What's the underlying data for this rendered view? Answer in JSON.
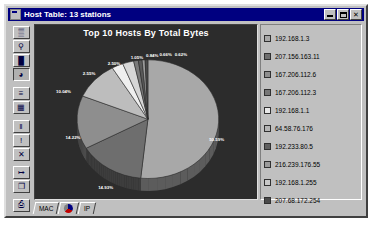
{
  "window": {
    "title": "Host Table: 13 stations",
    "icon": "app-icon",
    "buttons": [
      {
        "name": "minimize-button",
        "glyph": ""
      },
      {
        "name": "maximize-button",
        "glyph": ""
      },
      {
        "name": "close-button",
        "glyph": "✕"
      }
    ]
  },
  "toolbar": {
    "buttons": [
      {
        "name": "tool-table-icon",
        "glyph": "▒"
      },
      {
        "name": "tool-magnifier-icon",
        "glyph": "⚲"
      },
      {
        "name": "tool-bar-chart-icon",
        "glyph": "█"
      },
      {
        "name": "tool-pie-chart-icon",
        "glyph": "◕",
        "pressed": true
      },
      {
        "name": "tool-list-icon",
        "glyph": "≡"
      },
      {
        "name": "tool-grid-icon",
        "glyph": "▦"
      },
      {
        "name": "tool-pause-icon",
        "glyph": "‖"
      },
      {
        "name": "tool-alarm-icon",
        "glyph": "!"
      },
      {
        "name": "tool-delete-icon",
        "glyph": "✕"
      },
      {
        "name": "tool-export-icon",
        "glyph": "↦"
      },
      {
        "name": "tool-copy-icon",
        "glyph": "❐"
      },
      {
        "name": "tool-print-icon",
        "glyph": "⎙"
      }
    ]
  },
  "chart_data": {
    "type": "pie",
    "title": "Top 10 Hosts By Total Bytes",
    "xlabel": "",
    "ylabel": "",
    "legend_position": "right",
    "grid": false,
    "categories": [
      "192.168.1.3",
      "207.156.163.11",
      "167.206.112.6",
      "167.206.112.3",
      "192.168.1.1",
      "64.58.76.176",
      "192.233.80.5",
      "216.239.176.55",
      "192.168.1.255",
      "207.68.172.254"
    ],
    "values": [
      50.59,
      14.93,
      14.22,
      10.04,
      2.55,
      2.5,
      1.05,
      0.84,
      0.66,
      0.62
    ],
    "value_labels": [
      "50.59%",
      "14.93%",
      "14.22%",
      "10.04%",
      "2.55%",
      "2.50%",
      "1.05%",
      "0.84%",
      "0.66%",
      "0.62%"
    ],
    "colors": [
      "#a8a8a8",
      "#6e6e6e",
      "#8e8e8e",
      "#bdbdbd",
      "#efefef",
      "#d6d6d6",
      "#7a7a7a",
      "#5a5a5a",
      "#9b9b9b",
      "#4a4a4a"
    ],
    "unit": "percent"
  },
  "legend": {
    "items": [
      {
        "label": "192.168.1.3",
        "color": "#a8a8a8"
      },
      {
        "label": "207.156.163.11",
        "color": "#6e6e6e"
      },
      {
        "label": "167.206.112.6",
        "color": "#8e8e8e"
      },
      {
        "label": "167.206.112.3",
        "color": "#777777"
      },
      {
        "label": "192.168.1.1",
        "color": "#e8e8e8"
      },
      {
        "label": "64.58.76.176",
        "color": "#b5b5b5"
      },
      {
        "label": "192.233.80.5",
        "color": "#5f5f5f"
      },
      {
        "label": "216.239.176.55",
        "color": "#9b9b9b"
      },
      {
        "label": "192.168.1.255",
        "color": "#c9c9c9"
      },
      {
        "label": "207.68.172.254",
        "color": "#4a4a4a"
      }
    ]
  },
  "tabs": [
    {
      "name": "tab-mac",
      "label": "MAC"
    },
    {
      "name": "tab-pie",
      "label": ""
    },
    {
      "name": "tab-ip",
      "label": "IP"
    }
  ]
}
